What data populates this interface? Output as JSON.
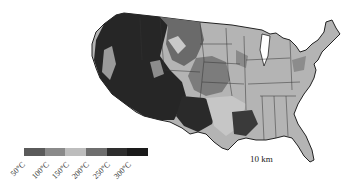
{
  "map": {
    "title": "",
    "region": "Contiguous United States",
    "states_outlined": true
  },
  "legend": {
    "segments": [
      {
        "label": "50°C",
        "color": "#5a5a5a"
      },
      {
        "label": "100°C",
        "color": "#8a8a8a"
      },
      {
        "label": "150°C",
        "color": "#bdbdbd"
      },
      {
        "label": "200°C",
        "color": "#6e6e6e"
      },
      {
        "label": "250°C",
        "color": "#2e2e2e"
      },
      {
        "label": "300°C",
        "color": "#1a1a1a"
      }
    ]
  },
  "scale_label": "10 km"
}
